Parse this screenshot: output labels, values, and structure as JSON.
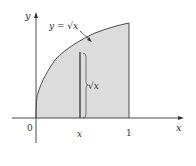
{
  "diagram": {
    "type": "area-under-curve",
    "function": "y = sqrt(x)",
    "labels": {
      "y_axis": "y",
      "x_axis": "x",
      "origin": "0",
      "x_one": "1",
      "strip_x": "x",
      "curve_label": "y = √x",
      "strip_height": "√x"
    },
    "colors": {
      "fill": "#dcdcdc",
      "stroke": "#4a4a4a",
      "text": "#333333",
      "background": "#ffffff"
    },
    "domain": [
      0,
      1
    ],
    "strip_position": 0.47
  }
}
